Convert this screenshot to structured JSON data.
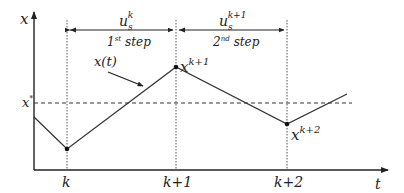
{
  "diagram": {
    "axes": {
      "y_label": "x",
      "x_label": "t"
    },
    "reference_line": {
      "label": "x",
      "label_sup": "*"
    },
    "curve_label": "x(t)",
    "ticks": [
      {
        "label": "k"
      },
      {
        "label": "k+1"
      },
      {
        "label": "k+2"
      }
    ],
    "points": [
      {
        "label": "x",
        "sup": "k+1"
      },
      {
        "label": "x",
        "sup": "k+2"
      }
    ],
    "steps": [
      {
        "u": "u",
        "u_sub": "s",
        "u_sup": "k",
        "step_num": "1",
        "step_num_sup": "st",
        "step_word": "step"
      },
      {
        "u": "u",
        "u_sub": "s",
        "u_sup": "k+1",
        "step_num": "2",
        "step_num_sup": "nd",
        "step_word": "step"
      }
    ]
  }
}
